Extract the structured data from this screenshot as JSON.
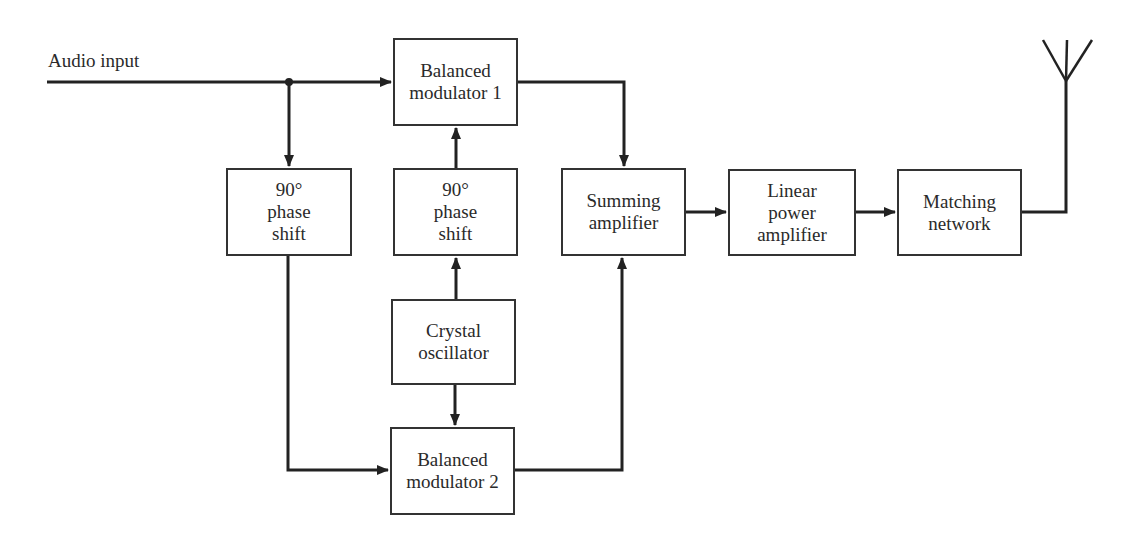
{
  "diagram": {
    "input_label": "Audio input",
    "blocks": {
      "bm1": {
        "line1": "Balanced",
        "line2": "modulator 1"
      },
      "ps_left": {
        "line1": "90°",
        "line2": "phase",
        "line3": "shift"
      },
      "ps_mid": {
        "line1": "90°",
        "line2": "phase",
        "line3": "shift"
      },
      "summing": {
        "line1": "Summing",
        "line2": "amplifier"
      },
      "linear": {
        "line1": "Linear",
        "line2": "power",
        "line3": "amplifier"
      },
      "matching": {
        "line1": "Matching",
        "line2": "network"
      },
      "crystal": {
        "line1": "Crystal",
        "line2": "oscillator"
      },
      "bm2": {
        "line1": "Balanced",
        "line2": "modulator 2"
      }
    },
    "output": "antenna-icon",
    "stroke_color": "#222222"
  }
}
